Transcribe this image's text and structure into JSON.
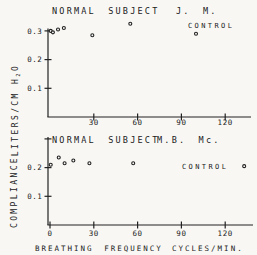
{
  "chart_data": [
    {
      "type": "scatter",
      "panel": "top",
      "title": "NORMAL SUBJECT",
      "subject_id": "J. M.",
      "annotation": "CONTROL",
      "points": [
        [
          0.5,
          0.3
        ],
        [
          2,
          0.295
        ],
        [
          5.5,
          0.305
        ],
        [
          9.5,
          0.31
        ],
        [
          29,
          0.285
        ],
        [
          55,
          0.325
        ]
      ],
      "control_point": [
        100,
        0.29
      ],
      "xticks": [
        30,
        60,
        90,
        120
      ],
      "xtick_labels": [
        "30",
        "60",
        "90",
        "120"
      ],
      "yticks": [
        0.1,
        0.2,
        0.3
      ],
      "ytick_labels": [
        "0.1",
        "0.2",
        "0.3"
      ],
      "yticks_unlabeled": [],
      "xlim": [
        0,
        139
      ],
      "ylim": [
        0,
        0.31
      ],
      "grid": false
    },
    {
      "type": "scatter",
      "panel": "bottom",
      "title": "NORMAL SUBJECT",
      "subject_id": "M.B. Mc.",
      "annotation": "CONTROL",
      "points": [
        [
          0.5,
          0.21
        ],
        [
          6,
          0.235
        ],
        [
          10,
          0.215
        ],
        [
          16,
          0.225
        ],
        [
          27,
          0.215
        ],
        [
          57,
          0.215
        ]
      ],
      "control_point": [
        133,
        0.205
      ],
      "xticks": [
        0,
        30,
        60,
        90,
        120
      ],
      "xtick_labels": [
        "0",
        "30",
        "60",
        "90",
        "120"
      ],
      "yticks": [
        0.1,
        0.2
      ],
      "ytick_labels": [
        "0.1",
        "0.2"
      ],
      "yticks_unlabeled": [
        0.3
      ],
      "xlim": [
        0,
        142
      ],
      "ylim": [
        0,
        0.31
      ],
      "grid": false
    }
  ],
  "axes": {
    "xlabel": "BREATHING FREQUENCY",
    "xlabel_units": "CYCLES/MIN.",
    "ylabel": "COMPLIANCE",
    "ylabel_units_prefix": "LITERS/CM H",
    "ylabel_units_sub": "2",
    "ylabel_units_suffix": "O"
  },
  "colors": {
    "background": "#f8f7f4",
    "ink": "#222222"
  }
}
